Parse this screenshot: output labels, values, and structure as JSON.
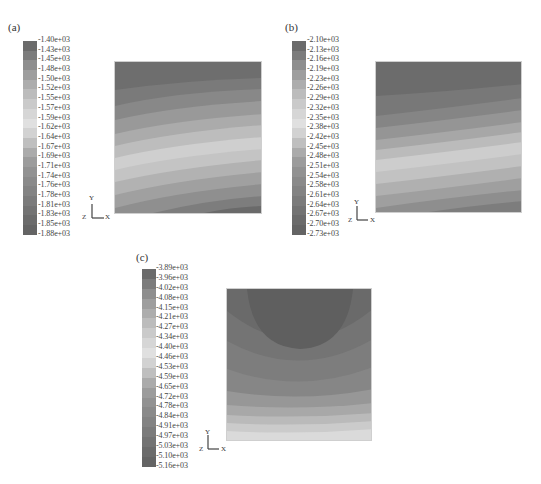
{
  "figure": {
    "panels": [
      {
        "label": "(a)",
        "legend": [
          "-1.40e+03",
          "-1.43e+03",
          "-1.45e+03",
          "-1.48e+03",
          "-1.50e+03",
          "-1.52e+03",
          "-1.55e+03",
          "-1.57e+03",
          "-1.59e+03",
          "-1.62e+03",
          "-1.64e+03",
          "-1.67e+03",
          "-1.69e+03",
          "-1.71e+03",
          "-1.74e+03",
          "-1.76e+03",
          "-1.78e+03",
          "-1.81e+03",
          "-1.83e+03",
          "-1.85e+03",
          "-1.88e+03"
        ],
        "axes": {
          "y": "Y",
          "x": "X",
          "z": "Z"
        }
      },
      {
        "label": "(b)",
        "legend": [
          "-2.10e+03",
          "-2.13e+03",
          "-2.16e+03",
          "-2.19e+03",
          "-2.23e+03",
          "-2.26e+03",
          "-2.29e+03",
          "-2.32e+03",
          "-2.35e+03",
          "-2.38e+03",
          "-2.42e+03",
          "-2.45e+03",
          "-2.48e+03",
          "-2.51e+03",
          "-2.54e+03",
          "-2.58e+03",
          "-2.61e+03",
          "-2.64e+03",
          "-2.67e+03",
          "-2.70e+03",
          "-2.73e+03"
        ],
        "axes": {
          "y": "Y",
          "x": "X",
          "z": "Z"
        }
      },
      {
        "label": "(c)",
        "legend": [
          "-3.89e+03",
          "-3.96e+03",
          "-4.02e+03",
          "-4.08e+03",
          "-4.15e+03",
          "-4.21e+03",
          "-4.27e+03",
          "-4.34e+03",
          "-4.40e+03",
          "-4.46e+03",
          "-4.53e+03",
          "-4.59e+03",
          "-4.65e+03",
          "-4.72e+03",
          "-4.78e+03",
          "-4.84e+03",
          "-4.91e+03",
          "-4.97e+03",
          "-5.03e+03",
          "-5.10e+03",
          "-5.16e+03"
        ],
        "axes": {
          "y": "Y",
          "x": "X",
          "z": "Z"
        }
      }
    ],
    "band_colors": [
      "#6b6b6b",
      "#7c7c7c",
      "#8e8e8e",
      "#9e9e9e",
      "#adadad",
      "#bcbcbc",
      "#cacaca",
      "#d6d6d6",
      "#e0e0e0",
      "#d2d2d2",
      "#bfbfbf",
      "#ababab",
      "#9c9c9c",
      "#929292",
      "#8a8a8a",
      "#838383",
      "#7b7b7b",
      "#737373",
      "#6b6b6b",
      "#646464"
    ]
  },
  "chart_data": [
    {
      "type": "heatmap",
      "title": "(a)",
      "colorbar_ticks": [
        -1400,
        -1430,
        -1450,
        -1480,
        -1500,
        -1520,
        -1550,
        -1570,
        -1590,
        -1620,
        -1640,
        -1670,
        -1690,
        -1710,
        -1740,
        -1760,
        -1780,
        -1810,
        -1830,
        -1850,
        -1880
      ],
      "colorbar_range": [
        -1880,
        -1400
      ],
      "colormap": "grayscale (dark-light-dark)",
      "description": "Square contour plot; curved bands arching down to the left; dark at top, light band through middle, dark at bottom-right corner",
      "axes_triad": [
        "Y",
        "Z",
        "X"
      ]
    },
    {
      "type": "heatmap",
      "title": "(b)",
      "colorbar_ticks": [
        -2100,
        -2130,
        -2160,
        -2190,
        -2230,
        -2260,
        -2290,
        -2320,
        -2350,
        -2380,
        -2420,
        -2450,
        -2480,
        -2510,
        -2540,
        -2580,
        -2610,
        -2640,
        -2670,
        -2700,
        -2730
      ],
      "colorbar_range": [
        -2730,
        -2100
      ],
      "colormap": "grayscale (dark-light-dark)",
      "description": "Square contour plot; nearly horizontal bands slightly sloping; dark top, light band in middle, darker toward bottom",
      "axes_triad": [
        "Y",
        "Z",
        "X"
      ]
    },
    {
      "type": "heatmap",
      "title": "(c)",
      "colorbar_ticks": [
        -3890,
        -3960,
        -4020,
        -4080,
        -4150,
        -4210,
        -4270,
        -4340,
        -4400,
        -4460,
        -4530,
        -4590,
        -4650,
        -4720,
        -4780,
        -4840,
        -4910,
        -4970,
        -5030,
        -5100,
        -5160
      ],
      "colorbar_range": [
        -5160,
        -3890
      ],
      "colormap": "grayscale (dark-light-dark)",
      "description": "Square contour plot; U-shaped bands; darkest semicircle at top center, medium gray mid, light bands along bottom edge",
      "axes_triad": [
        "Y",
        "Z",
        "X"
      ]
    }
  ]
}
